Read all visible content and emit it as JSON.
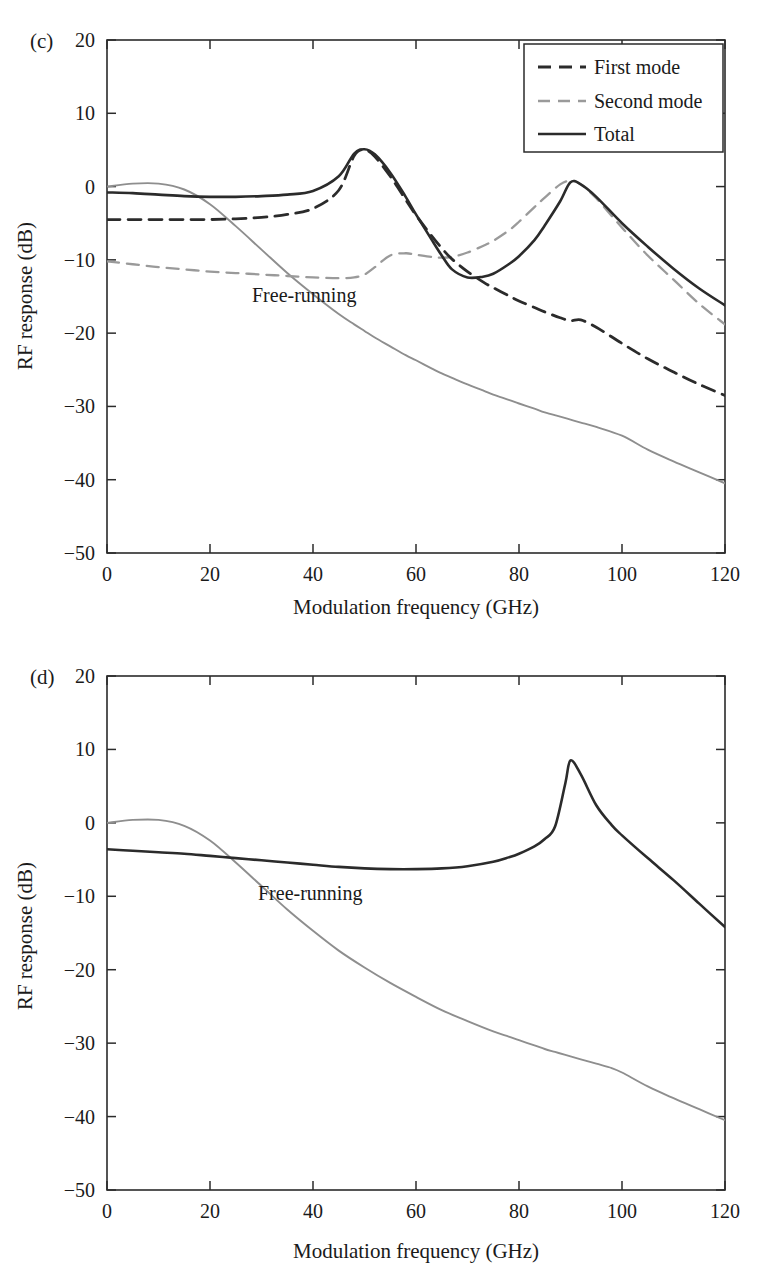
{
  "figure": {
    "background": "#ffffff",
    "colors": {
      "axis": "#2b2b2b",
      "total": "#2b2b2b",
      "first_mode": "#2b2b2b",
      "second_mode": "#9a9a9a",
      "free_running": "#8e8e8e"
    }
  },
  "panels": [
    {
      "tag": "(c)",
      "annotation": "Free-running",
      "legend_position": "top-right",
      "chart_data": {
        "type": "line",
        "title": "",
        "xlabel": "Modulation frequency (GHz)",
        "ylabel": "RF response (dB)",
        "xlim": [
          0,
          120
        ],
        "ylim": [
          -50,
          20
        ],
        "xticks": [
          0,
          20,
          40,
          60,
          80,
          100,
          120
        ],
        "yticks": [
          20,
          10,
          0,
          -10,
          -20,
          -30,
          -40,
          -50
        ],
        "grid": false,
        "legend": [
          "First mode",
          "Second mode",
          "Total"
        ],
        "x": [
          0,
          5,
          10,
          15,
          20,
          25,
          30,
          35,
          40,
          45,
          48,
          50,
          52,
          55,
          58,
          60,
          63,
          65,
          67,
          70,
          73,
          75,
          78,
          80,
          83,
          85,
          88,
          90,
          92,
          95,
          100,
          105,
          110,
          115,
          120
        ],
        "series": [
          {
            "name": "First mode",
            "style": "dashed",
            "color": "#2b2b2b",
            "values": [
              -4.5,
              -4.5,
              -4.5,
              -4.5,
              -4.5,
              -4.4,
              -4.2,
              -3.8,
              -3.0,
              -0.5,
              4.2,
              5.0,
              4.1,
              1.4,
              -1.8,
              -3.9,
              -6.7,
              -8.4,
              -9.9,
              -11.6,
              -13.0,
              -13.8,
              -14.9,
              -15.6,
              -16.5,
              -17.1,
              -17.9,
              -18.3,
              -18.2,
              -19.2,
              -21.4,
              -23.5,
              -25.3,
              -27.0,
              -28.5
            ]
          },
          {
            "name": "Second mode",
            "style": "dashed",
            "color": "#9a9a9a",
            "values": [
              -10.2,
              -10.6,
              -11.0,
              -11.3,
              -11.6,
              -11.8,
              -12.0,
              -12.2,
              -12.4,
              -12.5,
              -12.4,
              -12.0,
              -11.0,
              -9.4,
              -9.1,
              -9.3,
              -9.6,
              -9.7,
              -9.6,
              -9.0,
              -8.1,
              -7.4,
              -6.0,
              -4.8,
              -2.8,
              -1.5,
              0.3,
              0.8,
              0.3,
              -1.6,
              -5.6,
              -9.4,
              -12.7,
              -16.0,
              -18.8
            ]
          },
          {
            "name": "Total",
            "style": "solid",
            "color": "#2b2b2b",
            "values": [
              -0.8,
              -0.9,
              -1.1,
              -1.3,
              -1.4,
              -1.4,
              -1.3,
              -1.1,
              -0.6,
              1.4,
              4.5,
              5.1,
              4.4,
              1.9,
              -1.4,
              -3.8,
              -7.2,
              -9.4,
              -11.3,
              -12.4,
              -12.3,
              -11.9,
              -10.6,
              -9.5,
              -7.3,
              -5.3,
              -2.0,
              0.6,
              0.3,
              -1.4,
              -5.0,
              -8.2,
              -11.2,
              -13.9,
              -16.2
            ]
          },
          {
            "name": "Free-running",
            "style": "solid",
            "color": "#8e8e8e",
            "values": [
              0.0,
              0.4,
              0.4,
              -0.4,
              -2.4,
              -5.4,
              -8.6,
              -11.8,
              -14.7,
              -17.4,
              -18.8,
              -19.7,
              -20.6,
              -21.8,
              -23.0,
              -23.7,
              -24.8,
              -25.5,
              -26.1,
              -27.0,
              -27.8,
              -28.4,
              -29.1,
              -29.6,
              -30.3,
              -30.8,
              -31.4,
              -31.8,
              -32.2,
              -32.8,
              -34.0,
              -35.9,
              -37.5,
              -39.0,
              -40.5
            ]
          }
        ]
      }
    },
    {
      "tag": "(d)",
      "annotation": "Free-running",
      "legend_position": "none",
      "chart_data": {
        "type": "line",
        "title": "",
        "xlabel": "Modulation frequency (GHz)",
        "ylabel": "RF response (dB)",
        "xlim": [
          0,
          120
        ],
        "ylim": [
          -50,
          20
        ],
        "xticks": [
          0,
          20,
          40,
          60,
          80,
          100,
          120
        ],
        "yticks": [
          20,
          10,
          0,
          -10,
          -20,
          -30,
          -40,
          -50
        ],
        "grid": false,
        "legend": [],
        "x": [
          0,
          5,
          10,
          15,
          20,
          25,
          30,
          35,
          40,
          45,
          50,
          55,
          60,
          65,
          70,
          75,
          78,
          80,
          83,
          85,
          87,
          89,
          90,
          92,
          95,
          98,
          100,
          105,
          110,
          115,
          120
        ],
        "series": [
          {
            "name": "Total",
            "style": "solid",
            "color": "#2b2b2b",
            "values": [
              -3.6,
              -3.8,
              -4.0,
              -4.2,
              -4.5,
              -4.8,
              -5.1,
              -5.4,
              -5.7,
              -6.0,
              -6.2,
              -6.3,
              -6.3,
              -6.2,
              -5.9,
              -5.3,
              -4.7,
              -4.2,
              -3.2,
              -2.2,
              -0.5,
              5.4,
              8.5,
              6.6,
              2.4,
              -0.3,
              -1.7,
              -4.8,
              -7.8,
              -11.0,
              -14.2
            ]
          },
          {
            "name": "Free-running",
            "style": "solid",
            "color": "#8e8e8e",
            "values": [
              0.0,
              0.4,
              0.4,
              -0.4,
              -2.4,
              -5.4,
              -8.6,
              -11.8,
              -14.7,
              -17.4,
              -19.7,
              -21.8,
              -23.7,
              -25.5,
              -27.0,
              -28.4,
              -29.1,
              -29.6,
              -30.3,
              -30.8,
              -31.2,
              -31.6,
              -31.8,
              -32.2,
              -32.8,
              -33.4,
              -34.0,
              -35.9,
              -37.5,
              -39.0,
              -40.5
            ]
          }
        ]
      }
    }
  ]
}
